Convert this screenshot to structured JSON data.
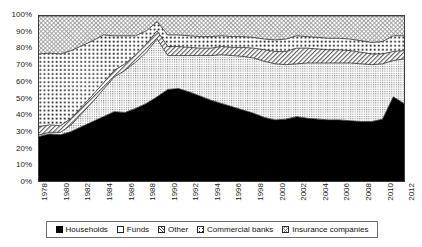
{
  "chart_data": {
    "type": "area",
    "stacked": true,
    "normalized": true,
    "title": "",
    "subtitle": "",
    "xlabel": "",
    "ylabel": "",
    "xlim": [
      1978,
      2012
    ],
    "ylim": [
      0,
      100
    ],
    "grid": false,
    "legend_position": "bottom",
    "y_ticks": [
      "0%",
      "10%",
      "20%",
      "30%",
      "40%",
      "50%",
      "60%",
      "70%",
      "80%",
      "90%",
      "100%"
    ],
    "y_tick_values": [
      0,
      10,
      20,
      30,
      40,
      50,
      60,
      70,
      80,
      90,
      100
    ],
    "x_tick_labels": [
      "1978",
      "1980",
      "1982",
      "1984",
      "1986",
      "1988",
      "1990",
      "1992",
      "1994",
      "1996",
      "1998",
      "2000",
      "2002",
      "2004",
      "2006",
      "2008",
      "2010",
      "2012"
    ],
    "x_tick_values": [
      1978,
      1980,
      1982,
      1984,
      1986,
      1988,
      1990,
      1992,
      1994,
      1996,
      1998,
      2000,
      2002,
      2004,
      2006,
      2008,
      2010,
      2012
    ],
    "x": [
      1978,
      1979,
      1980,
      1981,
      1982,
      1983,
      1984,
      1985,
      1986,
      1987,
      1988,
      1989,
      1990,
      1991,
      1992,
      1993,
      1994,
      1995,
      1996,
      1997,
      1998,
      1999,
      2000,
      2001,
      2002,
      2003,
      2004,
      2005,
      2006,
      2007,
      2008,
      2009,
      2010,
      2011,
      2012
    ],
    "series": [
      {
        "name": "Households",
        "pattern": "solid-black",
        "color": "#000000",
        "values": [
          27,
          28.5,
          28,
          30,
          33,
          36,
          39,
          42,
          41.5,
          44,
          47,
          51,
          55.5,
          56,
          54,
          51.5,
          49,
          47,
          45,
          43,
          41,
          38.5,
          37,
          37.5,
          39,
          38,
          37.5,
          37,
          37,
          36.5,
          36,
          36,
          37.5,
          51,
          47
        ]
      },
      {
        "name": "Funds",
        "pattern": "fine-dots",
        "color": "#dedede",
        "values": [
          1,
          1,
          1.5,
          4,
          8,
          12,
          16.5,
          21,
          25.5,
          28,
          31,
          35,
          20.5,
          20,
          22,
          24.5,
          27,
          29.5,
          31,
          32.5,
          33.5,
          34,
          34,
          33,
          32,
          33.5,
          34,
          34.5,
          34.5,
          35,
          35,
          34.5,
          33.5,
          22,
          27
        ]
      },
      {
        "name": "Other",
        "pattern": "diagonal-hatch",
        "color": "#c9c9c9",
        "values": [
          5,
          4.5,
          4,
          4,
          4,
          4,
          4,
          4,
          4,
          4.5,
          5,
          5,
          5.5,
          5.5,
          5,
          4.5,
          4.5,
          5,
          5,
          5.5,
          6,
          7,
          7.5,
          8,
          9.5,
          9,
          8.5,
          8,
          8,
          7.5,
          7,
          6.5,
          6,
          5.5,
          5
        ]
      },
      {
        "name": "Commercial banks",
        "pattern": "coarse-dots",
        "color": "#f0f0f0",
        "values": [
          44,
          43.5,
          43.5,
          41,
          37,
          33,
          29,
          21,
          17,
          11.5,
          8,
          5.5,
          7,
          7,
          7,
          7,
          7,
          6.5,
          6.5,
          6.5,
          6.5,
          6.5,
          7,
          7.5,
          7.5,
          7,
          7,
          7,
          7,
          7,
          7,
          7,
          7.5,
          9.5,
          9
        ]
      },
      {
        "name": "Insurance companies",
        "pattern": "light-crosshatch",
        "color": "#f6f6f6",
        "values": [
          23,
          22.5,
          23,
          21,
          18,
          15,
          11.5,
          12,
          12,
          12,
          9,
          3.5,
          11.5,
          11.5,
          12,
          12.5,
          12.5,
          12,
          12.5,
          12.5,
          13,
          14,
          14.5,
          14,
          12,
          12.5,
          13,
          13.5,
          13.5,
          14,
          15,
          16,
          15.5,
          12,
          12
        ]
      }
    ],
    "notes": {
      "households_peak": {
        "year": 1991,
        "value": 56
      },
      "households_start": {
        "year": 1978,
        "value": 27
      },
      "households_trough": {
        "year": 1999,
        "value": 38.5
      },
      "households_spike": {
        "year": 2011,
        "value": 51
      }
    }
  },
  "legend": {
    "items": [
      {
        "label": "Households",
        "swatch": "households-swatch-icon"
      },
      {
        "label": "Funds",
        "swatch": "funds-swatch-icon"
      },
      {
        "label": "Other",
        "swatch": "other-swatch-icon"
      },
      {
        "label": "Commercial banks",
        "swatch": "commercial-banks-swatch-icon"
      },
      {
        "label": "Insurance companies",
        "swatch": "insurance-companies-swatch-icon"
      }
    ]
  }
}
